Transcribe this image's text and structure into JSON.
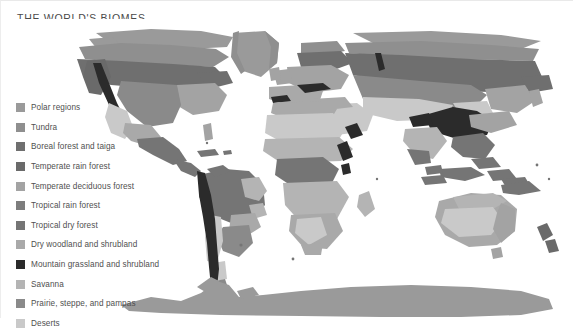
{
  "figure": {
    "title": "THE WORLD'S BIOMES",
    "background_color": "#ffffff",
    "title_color": "#4a4a4a",
    "projection": "world map, equirectangular-style with Antarctica band"
  },
  "legend": {
    "position": "lower-left over ocean area",
    "items": [
      {
        "label": "Polar regions",
        "color": "#9a9a9a",
        "key": "polar-regions"
      },
      {
        "label": "Tundra",
        "color": "#8f8f8f",
        "key": "tundra"
      },
      {
        "label": "Boreal forest and taiga",
        "color": "#6f6f6f",
        "key": "boreal-forest-and-taiga"
      },
      {
        "label": "Temperate rain forest",
        "color": "#6a6a6a",
        "key": "temperate-rain-forest"
      },
      {
        "label": "Temperate deciduous forest",
        "color": "#a3a3a3",
        "key": "temperate-deciduous-forest"
      },
      {
        "label": "Tropical rain forest",
        "color": "#7d7d7d",
        "key": "tropical-rain-forest"
      },
      {
        "label": "Tropical dry forest",
        "color": "#757575",
        "key": "tropical-dry-forest"
      },
      {
        "label": "Dry woodland and shrubland",
        "color": "#a9a9a9",
        "key": "dry-woodland-and-shrubland"
      },
      {
        "label": "Mountain grassland and shrubland",
        "color": "#2b2b2b",
        "key": "mountain-grassland-and-shrubland"
      },
      {
        "label": "Savanna",
        "color": "#b4b4b4",
        "key": "savanna"
      },
      {
        "label": "Prairie, steppe, and pampas",
        "color": "#8a8a8a",
        "key": "prairie-steppe-and-pampas"
      },
      {
        "label": "Deserts",
        "color": "#c9c9c9",
        "key": "deserts"
      }
    ]
  },
  "map_regions": {
    "note": "Landmasses shaded by biome class using the legend gray tones.",
    "labels": [
      "North America",
      "Greenland",
      "South America",
      "Europe",
      "Africa",
      "Asia",
      "Australia",
      "Antarctica"
    ]
  }
}
